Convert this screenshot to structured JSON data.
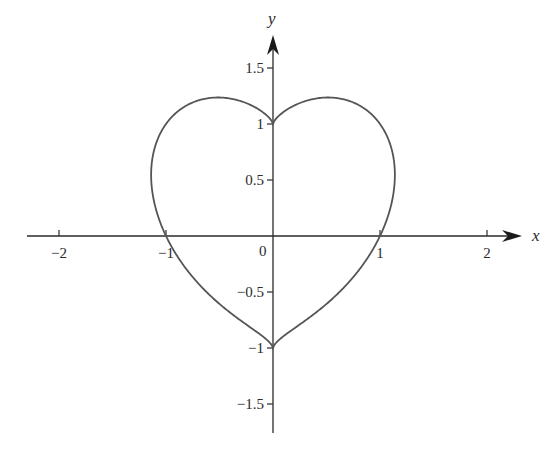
{
  "chart_data": {
    "type": "line",
    "title": "",
    "xlabel": "x",
    "ylabel": "y",
    "equation": "(x^2 + y^2 - 1)^3 = x^2 y^3",
    "xlim": [
      -2.3,
      2.3
    ],
    "ylim": [
      -1.75,
      1.8
    ],
    "grid": false,
    "legend": null,
    "x_ticks": [
      {
        "value": -2,
        "label": "−2"
      },
      {
        "value": -1,
        "label": "−1"
      },
      {
        "value": 1,
        "label": "1"
      },
      {
        "value": 2,
        "label": "2"
      }
    ],
    "y_ticks": [
      {
        "value": 1.5,
        "label": "1.5"
      },
      {
        "value": 1,
        "label": "1"
      },
      {
        "value": 0.5,
        "label": "0.5"
      },
      {
        "value": -0.5,
        "label": "−0.5"
      },
      {
        "value": -1,
        "label": "−1"
      },
      {
        "value": -1.5,
        "label": "−1.5"
      }
    ],
    "origin_label": "0",
    "key_points": [
      {
        "x": 0,
        "y": 1,
        "note": "top cusp"
      },
      {
        "x": 0,
        "y": -1,
        "note": "bottom point"
      },
      {
        "x": -1,
        "y": 0
      },
      {
        "x": 1,
        "y": 0
      },
      {
        "x": -0.52,
        "y": 1.25,
        "note": "left lobe top"
      },
      {
        "x": 0.52,
        "y": 1.25,
        "note": "right lobe top"
      },
      {
        "x": -1.14,
        "y": 0.59,
        "note": "leftmost"
      },
      {
        "x": 1.14,
        "y": 0.59,
        "note": "rightmost"
      }
    ],
    "series": [
      {
        "name": "heart curve",
        "color": "#555555"
      }
    ]
  },
  "layout": {
    "origin_px": [
      273,
      236
    ],
    "x_unit_px": 107,
    "y_unit_px": 112,
    "x_axis_px": [
      27,
      522
    ],
    "y_axis_px": [
      433,
      35
    ],
    "axis_color": "#2a2a2a",
    "curve_color": "#555555"
  }
}
